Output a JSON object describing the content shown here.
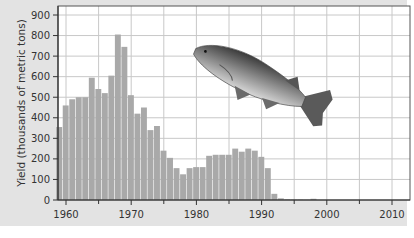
{
  "chart_data": {
    "type": "bar",
    "title": "",
    "xlabel": "",
    "ylabel": "Yield (thousands of metric tons)",
    "xlim": [
      1958,
      2013
    ],
    "ylim": [
      0,
      900
    ],
    "grid": true,
    "legend": "none",
    "x_ticks_major": [
      1960,
      1970,
      1980,
      1990,
      2000,
      2010
    ],
    "x_ticks_minor": [
      1965,
      1975,
      1985,
      1995,
      2005
    ],
    "y_ticks": [
      0,
      100,
      200,
      300,
      400,
      500,
      600,
      700,
      800,
      900
    ],
    "bar_color": "#a9a9a9",
    "series": [
      {
        "name": "Cod yield",
        "x": [
          1959,
          1960,
          1961,
          1962,
          1963,
          1964,
          1965,
          1966,
          1967,
          1968,
          1969,
          1970,
          1971,
          1972,
          1973,
          1974,
          1975,
          1976,
          1977,
          1978,
          1979,
          1980,
          1981,
          1982,
          1983,
          1984,
          1985,
          1986,
          1987,
          1988,
          1989,
          1990,
          1991,
          1992,
          1993,
          1994,
          1995,
          1996,
          1997,
          1998
        ],
        "values": [
          355,
          460,
          490,
          500,
          500,
          595,
          540,
          520,
          605,
          805,
          745,
          510,
          420,
          450,
          340,
          360,
          240,
          205,
          155,
          125,
          155,
          160,
          160,
          215,
          220,
          220,
          220,
          250,
          235,
          250,
          240,
          210,
          155,
          30,
          8,
          3,
          2,
          2,
          1,
          6
        ]
      }
    ],
    "annotations": [
      {
        "type": "image",
        "subject": "cod-fish-illustration"
      }
    ]
  }
}
